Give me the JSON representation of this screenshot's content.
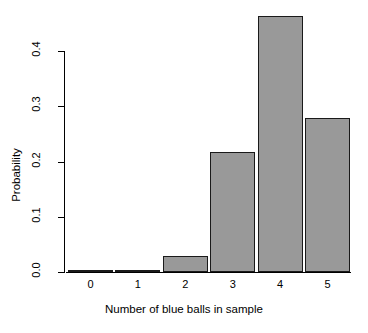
{
  "chart_data": {
    "type": "bar",
    "title": "",
    "subtitle": "",
    "xlabel": "Number of blue balls in sample",
    "ylabel": "Probability",
    "categories": [
      "0",
      "1",
      "2",
      "3",
      "4",
      "5"
    ],
    "values": [
      0.0,
      0.001,
      0.029,
      0.217,
      0.463,
      0.279
    ],
    "series": [
      {
        "name": "Probability",
        "values": [
          0.0,
          0.001,
          0.029,
          0.217,
          0.463,
          0.279
        ]
      }
    ],
    "ylim": [
      0.0,
      0.4
    ],
    "y_ticks": [
      "0.0",
      "0.1",
      "0.2",
      "0.3",
      "0.4"
    ],
    "y_tick_values": [
      0.0,
      0.1,
      0.2,
      0.3,
      0.4
    ],
    "x_ticks": [
      "0",
      "1",
      "2",
      "3",
      "4",
      "5"
    ],
    "grid": false,
    "legend": false,
    "legend_position": "none",
    "bar_fill_color": "#999999",
    "bar_border_color": "#1a1a1a",
    "axis_color": "#000000",
    "background_color": "#ffffff"
  }
}
